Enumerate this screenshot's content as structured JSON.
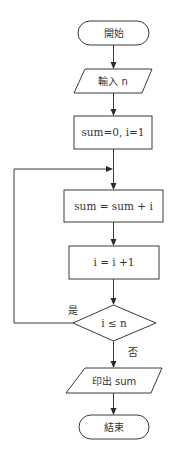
{
  "flowchart": {
    "nodes": {
      "start": {
        "label": "開始",
        "type": "terminal"
      },
      "input": {
        "label": "輸入 n",
        "type": "io"
      },
      "init": {
        "label": "sum=0, i=1",
        "type": "process"
      },
      "accumulate": {
        "label": "sum = sum + i",
        "type": "process"
      },
      "increment": {
        "label": "i = i +1",
        "type": "process"
      },
      "condition": {
        "label": "i ≤ n",
        "type": "decision"
      },
      "output": {
        "label": "印出 sum",
        "type": "io"
      },
      "end": {
        "label": "結束",
        "type": "terminal"
      }
    },
    "edge_labels": {
      "yes": "是",
      "no": "否"
    }
  }
}
